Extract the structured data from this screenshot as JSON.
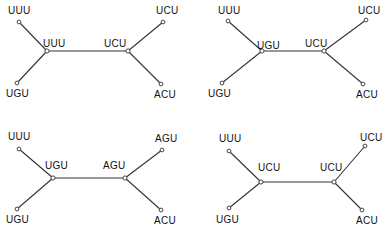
{
  "figure": {
    "type": "phylogenetic-tree-panels",
    "panel_count": 4,
    "background_color": "#ffffff",
    "line_color": "#333333",
    "node_fill_color": "#ffffff",
    "text_color": "#111111"
  },
  "panels": [
    {
      "id": "panel-1",
      "position": "top-left",
      "leaves": [
        {
          "name": "leaf-top-left",
          "label": "UUU",
          "label_x": 8,
          "label_y": 5,
          "node_x": 19,
          "node_y": 22
        },
        {
          "name": "leaf-bottom-left",
          "label": "UGU",
          "label_x": 6,
          "label_y": 88,
          "node_x": 17,
          "node_y": 83
        },
        {
          "name": "leaf-top-right",
          "label": "UCU",
          "label_x": 156,
          "label_y": 5,
          "node_x": 163,
          "node_y": 22
        },
        {
          "name": "leaf-bottom-right",
          "label": "ACU",
          "label_x": 154,
          "label_y": 89,
          "node_x": 161,
          "node_y": 84
        }
      ],
      "internal": [
        {
          "name": "internal-left",
          "label": "UUU",
          "label_x": 43,
          "label_y": 38,
          "node_x": 47,
          "node_y": 51
        },
        {
          "name": "internal-right",
          "label": "UCU",
          "label_x": 104,
          "label_y": 38,
          "node_x": 128,
          "node_y": 51
        }
      ]
    },
    {
      "id": "panel-2",
      "position": "top-right",
      "leaves": [
        {
          "name": "leaf-top-left",
          "label": "UUU",
          "label_x": 24,
          "label_y": 5,
          "node_x": 34,
          "node_y": 21
        },
        {
          "name": "leaf-bottom-left",
          "label": "UGU",
          "label_x": 14,
          "label_y": 88,
          "node_x": 28,
          "node_y": 83
        },
        {
          "name": "leaf-top-right",
          "label": "UCU",
          "label_x": 164,
          "label_y": 5,
          "node_x": 172,
          "node_y": 20
        },
        {
          "name": "leaf-bottom-right",
          "label": "ACU",
          "label_x": 162,
          "label_y": 89,
          "node_x": 169,
          "node_y": 84
        }
      ],
      "internal": [
        {
          "name": "internal-left",
          "label": "UGU",
          "label_x": 63,
          "label_y": 40,
          "node_x": 68,
          "node_y": 51
        },
        {
          "name": "internal-right",
          "label": "UCU",
          "label_x": 111,
          "label_y": 38,
          "node_x": 130,
          "node_y": 51
        }
      ]
    },
    {
      "id": "panel-3",
      "position": "bottom-left",
      "leaves": [
        {
          "name": "leaf-top-left",
          "label": "UUU",
          "label_x": 8,
          "label_y": 9,
          "node_x": 19,
          "node_y": 27
        },
        {
          "name": "leaf-bottom-left",
          "label": "UGU",
          "label_x": 6,
          "label_y": 92,
          "node_x": 17,
          "node_y": 87
        },
        {
          "name": "leaf-top-right",
          "label": "AGU",
          "label_x": 155,
          "label_y": 11,
          "node_x": 162,
          "node_y": 28
        },
        {
          "name": "leaf-bottom-right",
          "label": "ACU",
          "label_x": 154,
          "label_y": 93,
          "node_x": 161,
          "node_y": 88
        }
      ],
      "internal": [
        {
          "name": "internal-left",
          "label": "UGU",
          "label_x": 45,
          "label_y": 38,
          "node_x": 53,
          "node_y": 56
        },
        {
          "name": "internal-right",
          "label": "AGU",
          "label_x": 103,
          "label_y": 38,
          "node_x": 125,
          "node_y": 56
        }
      ]
    },
    {
      "id": "panel-4",
      "position": "bottom-right",
      "leaves": [
        {
          "name": "leaf-top-left",
          "label": "UUU",
          "label_x": 25,
          "label_y": 11,
          "node_x": 35,
          "node_y": 29
        },
        {
          "name": "leaf-bottom-left",
          "label": "UGU",
          "label_x": 22,
          "label_y": 92,
          "node_x": 35,
          "node_y": 86
        },
        {
          "name": "leaf-top-right",
          "label": "UCU",
          "label_x": 166,
          "label_y": 10,
          "node_x": 171,
          "node_y": 24
        },
        {
          "name": "leaf-bottom-right",
          "label": "ACU",
          "label_x": 162,
          "label_y": 93,
          "node_x": 168,
          "node_y": 88
        }
      ],
      "internal": [
        {
          "name": "internal-left",
          "label": "UCU",
          "label_x": 64,
          "label_y": 40,
          "node_x": 67,
          "node_y": 60
        },
        {
          "name": "internal-right",
          "label": "UCU",
          "label_x": 126,
          "label_y": 40,
          "node_x": 140,
          "node_y": 60
        }
      ]
    }
  ],
  "panel_origins": [
    {
      "name": "panel-origin-1",
      "left": 0,
      "top": 0
    },
    {
      "name": "panel-origin-2",
      "left": 194,
      "top": 0
    },
    {
      "name": "panel-origin-3",
      "left": 0,
      "top": 122
    },
    {
      "name": "panel-origin-4",
      "left": 194,
      "top": 122
    }
  ]
}
